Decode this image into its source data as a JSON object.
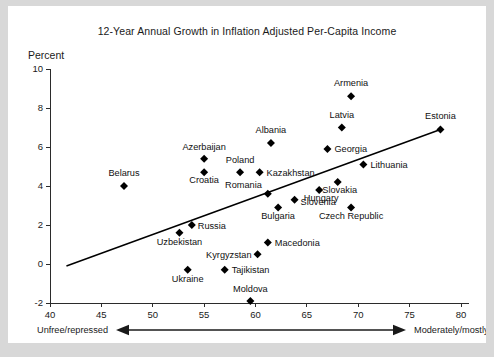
{
  "chart_data": {
    "type": "scatter",
    "title": "12-Year Annual Growth in Inflation Adjusted Per-Capita Income",
    "xlabel": "",
    "ylabel": "Percent",
    "xlim": [
      40,
      80
    ],
    "ylim": [
      -2,
      10
    ],
    "xticks": [
      40,
      45,
      50,
      55,
      60,
      65,
      70,
      75,
      80
    ],
    "yticks": [
      -2,
      0,
      2,
      4,
      6,
      8,
      10
    ],
    "grid": false,
    "legend": null,
    "points": [
      {
        "label": "Armenia",
        "x": 69.3,
        "y": 8.6,
        "label_dx": 0,
        "label_dy": -10,
        "anchor": "middle"
      },
      {
        "label": "Latvia",
        "x": 68.4,
        "y": 7.0,
        "label_dx": 0,
        "label_dy": -10,
        "anchor": "middle"
      },
      {
        "label": "Estonia",
        "x": 78.0,
        "y": 6.9,
        "label_dx": 0,
        "label_dy": -10,
        "anchor": "middle"
      },
      {
        "label": "Albania",
        "x": 61.5,
        "y": 6.2,
        "label_dx": 0,
        "label_dy": -10,
        "anchor": "middle"
      },
      {
        "label": "Georgia",
        "x": 67.0,
        "y": 5.9,
        "label_dx": 7,
        "label_dy": 3.5,
        "anchor": "start"
      },
      {
        "label": "Azerbaijan",
        "x": 55.0,
        "y": 5.4,
        "label_dx": 0,
        "label_dy": -9,
        "anchor": "middle"
      },
      {
        "label": "Lithuania",
        "x": 70.5,
        "y": 5.1,
        "label_dx": 7,
        "label_dy": 3.5,
        "anchor": "start"
      },
      {
        "label": "Poland",
        "x": 58.5,
        "y": 4.7,
        "label_dx": 0,
        "label_dy": -9,
        "anchor": "middle"
      },
      {
        "label": "Kazakhstan",
        "x": 60.4,
        "y": 4.7,
        "label_dx": 7,
        "label_dy": 3.5,
        "anchor": "start"
      },
      {
        "label": "Croatia",
        "x": 55.0,
        "y": 4.7,
        "label_dx": 0,
        "label_dy": 11,
        "anchor": "middle"
      },
      {
        "label": "Belarus",
        "x": 47.2,
        "y": 4.0,
        "label_dx": 0,
        "label_dy": -10,
        "anchor": "middle"
      },
      {
        "label": "Slovakia",
        "x": 68.0,
        "y": 4.2,
        "label_dx": 2,
        "label_dy": 11,
        "anchor": "middle"
      },
      {
        "label": "Hungary",
        "x": 66.2,
        "y": 3.8,
        "label_dx": 2,
        "label_dy": 11,
        "anchor": "middle"
      },
      {
        "label": "Romania",
        "x": 61.2,
        "y": 3.6,
        "label_dx": -6,
        "label_dy": -6,
        "anchor": "end"
      },
      {
        "label": "Slovenia",
        "x": 63.8,
        "y": 3.3,
        "label_dx": 6,
        "label_dy": 5,
        "anchor": "start"
      },
      {
        "label": "Czech Republic",
        "x": 69.3,
        "y": 2.9,
        "label_dx": 0,
        "label_dy": 12,
        "anchor": "middle"
      },
      {
        "label": "Bulgaria",
        "x": 62.2,
        "y": 2.9,
        "label_dx": 0,
        "label_dy": 12,
        "anchor": "middle"
      },
      {
        "label": "Russia",
        "x": 53.8,
        "y": 2.0,
        "label_dx": 6,
        "label_dy": 4,
        "anchor": "start"
      },
      {
        "label": "Uzbekistan",
        "x": 52.6,
        "y": 1.6,
        "label_dx": 0,
        "label_dy": 12,
        "anchor": "middle"
      },
      {
        "label": "Macedonia",
        "x": 61.2,
        "y": 1.1,
        "label_dx": 7,
        "label_dy": 3.5,
        "anchor": "start"
      },
      {
        "label": "Kyrgyzstan",
        "x": 60.2,
        "y": 0.5,
        "label_dx": -6,
        "label_dy": 3.5,
        "anchor": "end"
      },
      {
        "label": "Tajikistan",
        "x": 57.0,
        "y": -0.3,
        "label_dx": 7,
        "label_dy": 3.5,
        "anchor": "start"
      },
      {
        "label": "Ukraine",
        "x": 53.4,
        "y": -0.3,
        "label_dx": 0,
        "label_dy": 12,
        "anchor": "middle"
      },
      {
        "label": "Moldova",
        "x": 59.5,
        "y": -1.9,
        "label_dx": 0,
        "label_dy": -9,
        "anchor": "middle"
      }
    ],
    "trendline": {
      "x1": 41.6,
      "y1": -0.1,
      "x2": 78.0,
      "y2": 6.9
    }
  },
  "footer": {
    "left_label": "Unfree/repressed",
    "right_label": "Moderately/mostly free"
  }
}
